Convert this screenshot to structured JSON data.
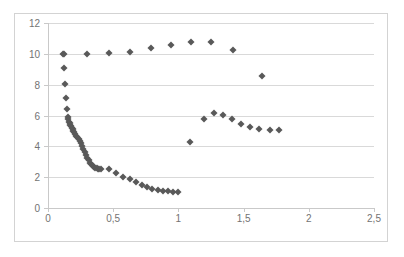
{
  "chart_data": {
    "type": "scatter",
    "title": "",
    "xlabel": "",
    "ylabel": "",
    "xlim": [
      0,
      2.5
    ],
    "ylim": [
      0,
      12
    ],
    "grid": true,
    "legend": false,
    "marker": {
      "shape": "diamond",
      "color": "#595959",
      "size": 5
    },
    "xticks": [
      0,
      0.5,
      1,
      1.5,
      2,
      2.5
    ],
    "xtick_labels": [
      "0",
      "0,5",
      "1",
      "1,5",
      "2",
      "2,5"
    ],
    "yticks": [
      0,
      2,
      4,
      6,
      8,
      10,
      12
    ],
    "ytick_labels": [
      "0",
      "2",
      "4",
      "6",
      "8",
      "10",
      "12"
    ],
    "decimal_separator": ",",
    "series": [
      {
        "name": "series-1",
        "points": [
          [
            0.115,
            10.0
          ],
          [
            0.122,
            9.05
          ],
          [
            0.128,
            8.05
          ],
          [
            0.135,
            7.15
          ],
          [
            0.145,
            6.4
          ],
          [
            0.152,
            5.9
          ],
          [
            0.156,
            5.75
          ],
          [
            0.16,
            5.6
          ],
          [
            0.165,
            5.5
          ],
          [
            0.17,
            5.4
          ],
          [
            0.176,
            5.3
          ],
          [
            0.182,
            5.2
          ],
          [
            0.188,
            5.1
          ],
          [
            0.195,
            5.0
          ],
          [
            0.202,
            4.9
          ],
          [
            0.21,
            4.8
          ],
          [
            0.218,
            4.7
          ],
          [
            0.226,
            4.6
          ],
          [
            0.234,
            4.5
          ],
          [
            0.243,
            4.35
          ],
          [
            0.252,
            4.2
          ],
          [
            0.262,
            4.0
          ],
          [
            0.272,
            3.85
          ],
          [
            0.282,
            3.65
          ],
          [
            0.292,
            3.45
          ],
          [
            0.302,
            3.25
          ],
          [
            0.312,
            3.1
          ],
          [
            0.322,
            2.95
          ],
          [
            0.332,
            2.85
          ],
          [
            0.342,
            2.75
          ],
          [
            0.352,
            2.68
          ],
          [
            0.362,
            2.62
          ],
          [
            0.372,
            2.58
          ],
          [
            0.382,
            2.54
          ],
          [
            0.392,
            2.52
          ],
          [
            0.405,
            2.51
          ],
          [
            0.47,
            2.5
          ],
          [
            0.52,
            2.3
          ],
          [
            0.575,
            2.0
          ],
          [
            0.63,
            1.85
          ],
          [
            0.675,
            1.7
          ],
          [
            0.72,
            1.5
          ],
          [
            0.76,
            1.35
          ],
          [
            0.8,
            1.25
          ],
          [
            0.84,
            1.15
          ],
          [
            0.88,
            1.1
          ],
          [
            0.92,
            1.08
          ],
          [
            0.96,
            1.06
          ],
          [
            1.0,
            1.05
          ],
          [
            0.122,
            10.0
          ],
          [
            0.3,
            10.0
          ],
          [
            0.47,
            10.05
          ],
          [
            0.63,
            10.15
          ],
          [
            0.79,
            10.35
          ],
          [
            0.94,
            10.6
          ],
          [
            1.1,
            10.8
          ],
          [
            1.25,
            10.8
          ],
          [
            1.42,
            10.25
          ],
          [
            1.64,
            8.55
          ],
          [
            1.09,
            4.3
          ],
          [
            1.2,
            5.75
          ],
          [
            1.27,
            6.15
          ],
          [
            1.34,
            6.05
          ],
          [
            1.41,
            5.75
          ],
          [
            1.48,
            5.45
          ],
          [
            1.55,
            5.25
          ],
          [
            1.62,
            5.1
          ],
          [
            1.7,
            5.05
          ],
          [
            1.77,
            5.05
          ]
        ]
      }
    ]
  },
  "figure": {
    "background_color": "#ffffff",
    "border_color": "#d3d3d3",
    "gridline_color": "#d9d9d9",
    "axis_color": "#c9c9c9",
    "tick_text_color": "#737373"
  }
}
